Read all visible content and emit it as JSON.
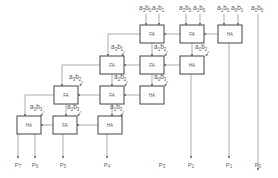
{
  "diagram": {
    "cells": [
      {
        "id": "r1c1",
        "type": "FA",
        "x": 140,
        "y": 25
      },
      {
        "id": "r1c2",
        "type": "FA",
        "x": 180,
        "y": 25
      },
      {
        "id": "r1c3",
        "type": "HA",
        "x": 218,
        "y": 25
      },
      {
        "id": "r2c1",
        "type": "FA",
        "x": 100,
        "y": 56
      },
      {
        "id": "r2c2",
        "type": "FA",
        "x": 140,
        "y": 56
      },
      {
        "id": "r2c3",
        "type": "HA",
        "x": 180,
        "y": 56
      },
      {
        "id": "r3c1",
        "type": "FA",
        "x": 54,
        "y": 86
      },
      {
        "id": "r3c2",
        "type": "FA",
        "x": 100,
        "y": 86
      },
      {
        "id": "r3c3",
        "type": "HA",
        "x": 140,
        "y": 86
      },
      {
        "id": "r4c1",
        "type": "HA",
        "x": 17,
        "y": 116
      },
      {
        "id": "r4c2",
        "type": "FA",
        "x": 53,
        "y": 116
      },
      {
        "id": "r4c3",
        "type": "HA",
        "x": 98,
        "y": 116
      }
    ],
    "top_inputs": [
      {
        "a": "3",
        "b": "0",
        "x": 146
      },
      {
        "a": "2",
        "b": "1",
        "x": 159
      },
      {
        "a": "2",
        "b": "0",
        "x": 186
      },
      {
        "a": "1",
        "b": "0",
        "x": 200
      },
      {
        "a": "1",
        "b": "0",
        "x": 224
      },
      {
        "a": "0",
        "b": "1",
        "x": 238
      },
      {
        "a": "0",
        "b": "0",
        "x": 258
      }
    ],
    "side_inputs": [
      {
        "a": "3",
        "b": "1",
        "x": 119,
        "y": 47
      },
      {
        "a": "1",
        "b": "2",
        "x": 162,
        "y": 47
      },
      {
        "a": "0",
        "b": "2",
        "x": 203,
        "y": 47
      },
      {
        "a": "3",
        "b": "2",
        "x": 77,
        "y": 77
      },
      {
        "a": "2",
        "b": "2",
        "x": 122,
        "y": 77
      },
      {
        "a": "0",
        "b": "3",
        "x": 162,
        "y": 77
      },
      {
        "a": "3",
        "b": "3",
        "x": 38,
        "y": 107
      },
      {
        "a": "2",
        "b": "3",
        "x": 75,
        "y": 107
      },
      {
        "a": "1",
        "b": "3",
        "x": 118,
        "y": 107
      }
    ],
    "outputs": [
      {
        "label": "P",
        "sub": "7",
        "x": 18
      },
      {
        "label": "P",
        "sub": "6",
        "x": 35
      },
      {
        "label": "P",
        "sub": "5",
        "x": 63
      },
      {
        "label": "P",
        "sub": "4",
        "x": 107
      },
      {
        "label": "P",
        "sub": "3",
        "x": 162
      },
      {
        "label": "P",
        "sub": "2",
        "x": 191
      },
      {
        "label": "P",
        "sub": "1",
        "x": 229
      },
      {
        "label": "P",
        "sub": "0",
        "x": 258
      }
    ]
  }
}
